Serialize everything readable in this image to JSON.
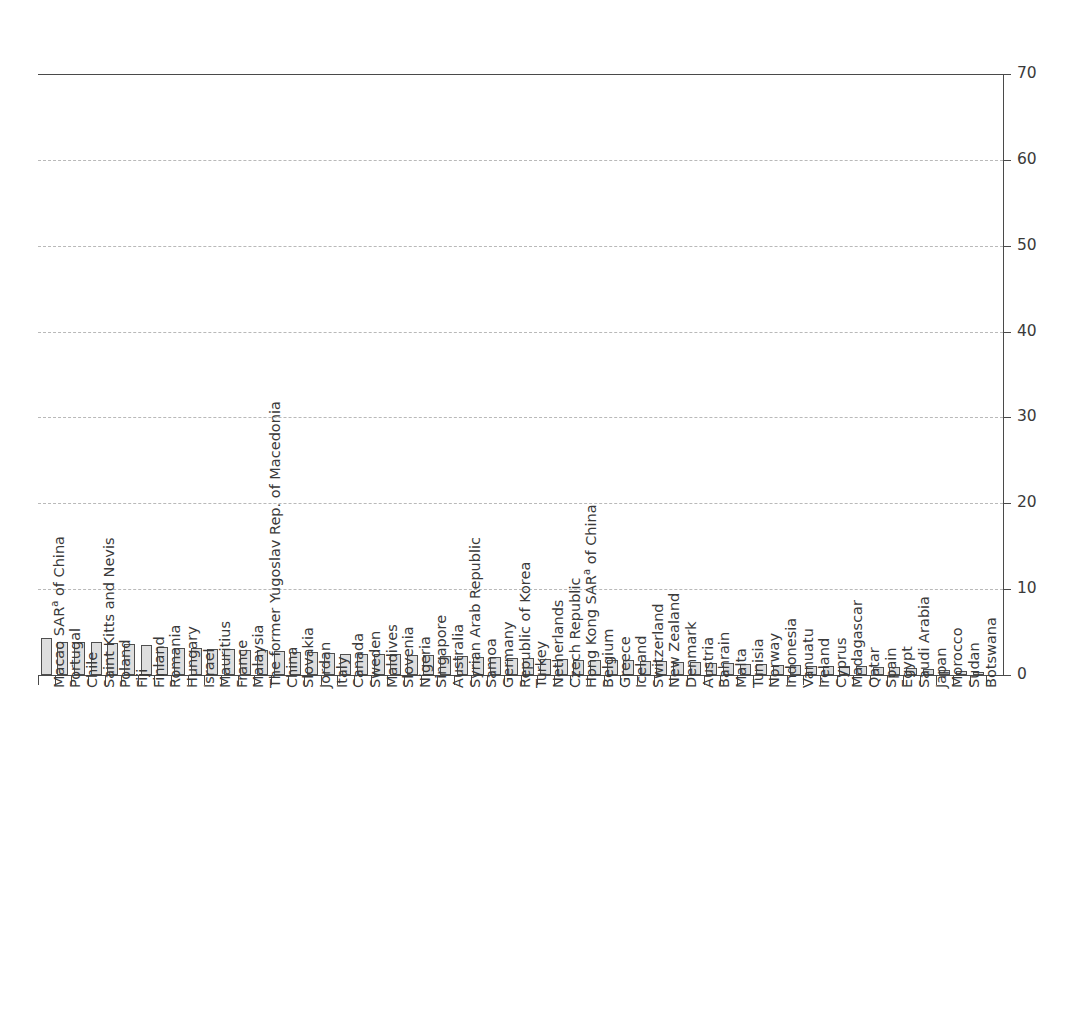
{
  "chart_data": {
    "type": "bar",
    "title": "",
    "subtitle": "",
    "xlabel": "",
    "ylabel": "",
    "ylim": [
      0,
      70
    ],
    "ytick_step": 10,
    "ytick_labels": [
      "0",
      "10",
      "20",
      "30",
      "40",
      "50",
      "60",
      "70"
    ],
    "ytick_values": [
      0,
      10,
      20,
      30,
      40,
      50,
      60,
      70
    ],
    "grid": "horizontal-dashed",
    "legend": "none",
    "orientation": "vertical",
    "bar_fill": "#dedede",
    "bar_edge": "#4f4f4f",
    "axis_color": "#4a4a4a",
    "grid_color": "#b9b9b9",
    "footnote_marker": "a",
    "categories": [
      "Macao SAR|a| of China",
      "Portugal",
      "Chile",
      "Saint Kitts and Nevis",
      "Poland",
      "Fiji",
      "Finland",
      "Romania",
      "Hungary",
      "Israel",
      "Mauritius",
      "France",
      "Malaysia",
      "The former Yugoslav Rep. of Macedonia",
      "China",
      "Slovakia",
      "Jordan",
      "Italy",
      "Canada",
      "Sweden",
      "Maldives",
      "Slovenia",
      "Nigeria",
      "Singapore",
      "Australia",
      "Syrian Arab Republic",
      "Samoa",
      "Germany",
      "Republic of Korea",
      "Turkey",
      "Netherlands",
      "Czech Republic",
      "Hong Kong SAR|a| of China",
      "Belgium",
      "Greece",
      "Iceland",
      "Switzerland",
      "New Zealand",
      "Denmark",
      "Austria",
      "Bahrain",
      "Malta",
      "Tunisia",
      "Norway",
      "Indonesia",
      "Vanuatu",
      "Ireland",
      "Cyprus",
      "Madagascar",
      "Qatar",
      "Spain",
      "Egypt",
      "Saudi Arabia",
      "Japan",
      "Morocco",
      "Sudan",
      "Botswana"
    ],
    "values": [
      4.3,
      3.9,
      3.9,
      3.8,
      3.7,
      3.6,
      3.5,
      3.3,
      3.2,
      3.1,
      3.0,
      3.0,
      2.9,
      2.9,
      2.8,
      2.7,
      2.7,
      2.6,
      2.5,
      2.5,
      2.4,
      2.4,
      2.3,
      2.3,
      2.2,
      2.2,
      2.1,
      2.1,
      2.0,
      2.0,
      1.9,
      1.9,
      1.8,
      1.8,
      1.7,
      1.7,
      1.6,
      1.6,
      1.5,
      1.5,
      1.4,
      1.4,
      1.3,
      1.3,
      1.2,
      1.2,
      1.1,
      1.1,
      1.0,
      1.0,
      0.9,
      0.9,
      0.8,
      0.7,
      0.6,
      0.5,
      0.3
    ]
  }
}
